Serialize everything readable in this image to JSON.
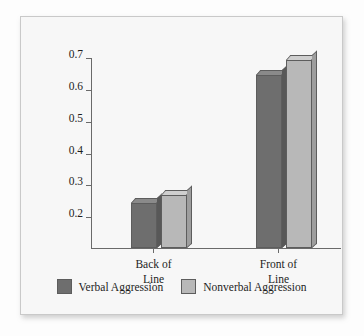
{
  "chart_data": {
    "type": "bar",
    "title": "",
    "xlabel": "",
    "ylabel": "Mean Aggression Score",
    "categories": [
      "Back of\nLine",
      "Front of\nLine"
    ],
    "series": [
      {
        "name": "Verbal Aggression",
        "values": [
          0.24,
          0.645
        ],
        "color": "#6e6e6e"
      },
      {
        "name": "Nonverbal Aggression",
        "values": [
          0.265,
          0.69
        ],
        "color": "#b8b8b8"
      }
    ],
    "ylim": [
      0.1,
      0.7
    ],
    "yticks": [
      "0.2",
      "0.3",
      "0.4",
      "0.5",
      "0.6",
      "0.7"
    ],
    "ytick_values": [
      0.2,
      0.3,
      0.4,
      0.5,
      0.6,
      0.7
    ],
    "grid": false,
    "legend_position": "bottom",
    "style": "3d-bar"
  },
  "axis": {
    "y_title": "Mean Aggression Score",
    "ticks": [
      {
        "label": "0.7",
        "value": 0.7
      },
      {
        "label": "0.6",
        "value": 0.6
      },
      {
        "label": "0.5",
        "value": 0.5
      },
      {
        "label": "0.4",
        "value": 0.4
      },
      {
        "label": "0.3",
        "value": 0.3
      },
      {
        "label": "0.2",
        "value": 0.2
      }
    ]
  },
  "categories": [
    {
      "line1": "Back of",
      "line2": "Line"
    },
    {
      "line1": "Front of",
      "line2": "Line"
    }
  ],
  "legend": {
    "items": [
      {
        "label": "Verbal Aggression",
        "color": "#6e6e6e"
      },
      {
        "label": "Nonverbal Aggression",
        "color": "#b8b8b8"
      }
    ]
  },
  "colors": {
    "bar_dark": "#6e6e6e",
    "bar_light": "#b8b8b8",
    "axis": "#6a6a6a",
    "text": "#1d1d1d",
    "panel_background": "#f7f7f7",
    "page_background": "#fdfdfd"
  }
}
